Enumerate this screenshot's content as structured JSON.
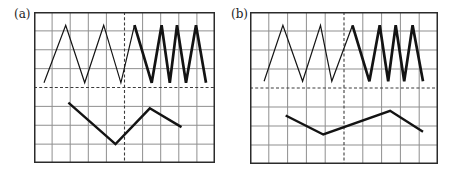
{
  "figure": {
    "background_color": "#ffffff",
    "description_units": "grid cells, origin at panel top-left, y increases downward"
  },
  "chart_data": [
    {
      "type": "line",
      "title": "(a)",
      "xlabel": "",
      "ylabel": "",
      "xlim": [
        0,
        10
      ],
      "ylim": [
        0,
        8
      ],
      "grid": "on",
      "grid_cols": 10,
      "grid_rows": 8,
      "grid_line_color": "#8f8f8f",
      "border_color": "#2b2b2b",
      "wave_color": "#131313",
      "dashed_center_lines": {
        "vertical_at_col": 5,
        "horizontal_at_row": 4,
        "color": "#3c3c3c"
      },
      "series": [
        {
          "name": "upper-wave-slow-thin",
          "stroke_width": 1.2,
          "points": [
            [
              0.55,
              3.75
            ],
            [
              1.75,
              0.7
            ],
            [
              2.8,
              3.75
            ],
            [
              3.85,
              0.7
            ],
            [
              4.8,
              3.75
            ],
            [
              5.55,
              0.7
            ]
          ]
        },
        {
          "name": "upper-wave-fast-thick",
          "stroke_width": 2.7,
          "points": [
            [
              5.55,
              0.7
            ],
            [
              6.5,
              3.75
            ],
            [
              7.05,
              0.7
            ],
            [
              7.5,
              3.75
            ],
            [
              7.9,
              0.7
            ],
            [
              8.4,
              3.75
            ],
            [
              8.95,
              0.7
            ],
            [
              9.5,
              3.75
            ]
          ]
        },
        {
          "name": "lower-wave",
          "stroke_width": 2.4,
          "points": [
            [
              1.9,
              4.8
            ],
            [
              4.5,
              7.0
            ],
            [
              6.4,
              5.1
            ],
            [
              8.15,
              6.1
            ]
          ]
        }
      ]
    },
    {
      "type": "line",
      "title": "(b)",
      "xlabel": "",
      "ylabel": "",
      "xlim": [
        0,
        10
      ],
      "ylim": [
        0,
        8
      ],
      "grid": "on",
      "grid_cols": 10,
      "grid_rows": 8,
      "grid_line_color": "#8f8f8f",
      "border_color": "#2b2b2b",
      "wave_color": "#131313",
      "dashed_center_lines": {
        "vertical_at_col": 5,
        "horizontal_at_row": 4,
        "color": "#3c3c3c"
      },
      "series": [
        {
          "name": "upper-wave-slow-thin",
          "stroke_width": 1.2,
          "points": [
            [
              0.75,
              3.65
            ],
            [
              1.75,
              0.7
            ],
            [
              2.8,
              3.65
            ],
            [
              3.75,
              0.7
            ],
            [
              4.35,
              3.65
            ],
            [
              5.45,
              0.7
            ]
          ]
        },
        {
          "name": "upper-wave-fast-thick",
          "stroke_width": 2.7,
          "points": [
            [
              5.45,
              0.7
            ],
            [
              6.35,
              3.65
            ],
            [
              6.9,
              0.7
            ],
            [
              7.35,
              3.65
            ],
            [
              7.75,
              0.7
            ],
            [
              8.2,
              3.65
            ],
            [
              8.65,
              0.7
            ],
            [
              9.2,
              3.65
            ]
          ]
        },
        {
          "name": "lower-wave",
          "stroke_width": 2.4,
          "points": [
            [
              1.9,
              5.45
            ],
            [
              3.9,
              6.45
            ],
            [
              7.45,
              5.2
            ],
            [
              9.2,
              6.3
            ]
          ]
        }
      ]
    }
  ]
}
